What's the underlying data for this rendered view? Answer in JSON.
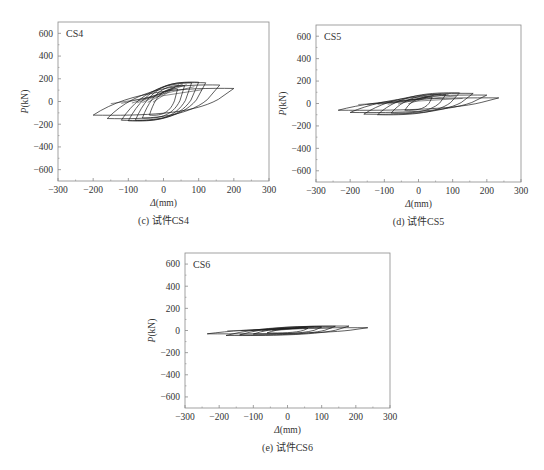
{
  "chart_data": [
    {
      "type": "line",
      "panel_label": "CS4",
      "caption": "(c) 试件CS4",
      "title": "",
      "xlabel": "Δ(mm)",
      "ylabel": "P(kN)",
      "xlim": [
        -300,
        300
      ],
      "ylim": [
        -700,
        700
      ],
      "xticks": [
        -300,
        -200,
        -100,
        0,
        100,
        200,
        300
      ],
      "yticks": [
        600,
        400,
        200,
        0,
        -200,
        -400,
        -600
      ],
      "grid": false,
      "legend": "none",
      "description": "Hysteresis loops (load P vs displacement Δ), peak ≈ ±170 kN, max displacement ≈ ±200 mm",
      "loops": [
        {
          "disp": 40,
          "p_pos": 110,
          "p_neg": -120,
          "p_unload": 30
        },
        {
          "disp": 60,
          "p_pos": 140,
          "p_neg": -145,
          "p_unload": 40
        },
        {
          "disp": 80,
          "p_pos": 165,
          "p_neg": -165,
          "p_unload": 50
        },
        {
          "disp": 100,
          "p_pos": 170,
          "p_neg": -170,
          "p_unload": 60
        },
        {
          "disp": 120,
          "p_pos": 165,
          "p_neg": -165,
          "p_unload": 70
        },
        {
          "disp": 160,
          "p_pos": 145,
          "p_neg": -150,
          "p_unload": 85
        },
        {
          "disp": 200,
          "p_pos": 115,
          "p_neg": -120,
          "p_unload": 95
        }
      ]
    },
    {
      "type": "line",
      "panel_label": "CS5",
      "caption": "(d) 试件CS5",
      "title": "",
      "xlabel": "Δ(mm)",
      "ylabel": "P(kN)",
      "xlim": [
        -300,
        300
      ],
      "ylim": [
        -700,
        700
      ],
      "xticks": [
        -300,
        -200,
        -100,
        0,
        100,
        200,
        300
      ],
      "yticks": [
        600,
        400,
        200,
        0,
        -200,
        -400,
        -600
      ],
      "grid": false,
      "legend": "none",
      "description": "Hysteresis loops, peak ≈ ±100 kN, max displacement ≈ ±235 mm",
      "loops": [
        {
          "disp": 40,
          "p_pos": 55,
          "p_neg": -60,
          "p_unload": 15
        },
        {
          "disp": 80,
          "p_pos": 80,
          "p_neg": -85,
          "p_unload": 25
        },
        {
          "disp": 120,
          "p_pos": 95,
          "p_neg": -100,
          "p_unload": 35
        },
        {
          "disp": 160,
          "p_pos": 90,
          "p_neg": -95,
          "p_unload": 40
        },
        {
          "disp": 200,
          "p_pos": 75,
          "p_neg": -80,
          "p_unload": 45
        },
        {
          "disp": 235,
          "p_pos": 50,
          "p_neg": -60,
          "p_unload": 45
        }
      ]
    },
    {
      "type": "line",
      "panel_label": "CS6",
      "caption": "(e) 试件CS6",
      "title": "",
      "xlabel": "Δ(mm)",
      "ylabel": "P(kN)",
      "xlim": [
        -300,
        300
      ],
      "ylim": [
        -700,
        700
      ],
      "xticks": [
        -300,
        -200,
        -100,
        0,
        100,
        200,
        300
      ],
      "yticks": [
        600,
        400,
        200,
        0,
        -200,
        -400,
        -600
      ],
      "grid": false,
      "legend": "none",
      "description": "Narrow hysteresis loops, peak ≈ ±40 kN, max displacement ≈ ±235 mm",
      "loops": [
        {
          "disp": 60,
          "p_pos": 20,
          "p_neg": -22,
          "p_unload": 6
        },
        {
          "disp": 100,
          "p_pos": 30,
          "p_neg": -32,
          "p_unload": 8
        },
        {
          "disp": 140,
          "p_pos": 38,
          "p_neg": -40,
          "p_unload": 10
        },
        {
          "disp": 180,
          "p_pos": 40,
          "p_neg": -45,
          "p_unload": 12
        },
        {
          "disp": 235,
          "p_pos": 25,
          "p_neg": -30,
          "p_unload": 12
        }
      ]
    }
  ],
  "panels": [
    {
      "frame": {
        "left": 58,
        "top": 22,
        "right": 269,
        "bottom": 181
      }
    },
    {
      "frame": {
        "left": 316,
        "top": 25,
        "right": 521,
        "bottom": 182
      }
    },
    {
      "frame": {
        "left": 185,
        "top": 253,
        "right": 390,
        "bottom": 408
      }
    }
  ],
  "colors": {
    "axis": "#8a8a8a",
    "curve": "#1a1a1a",
    "text": "#333333"
  }
}
